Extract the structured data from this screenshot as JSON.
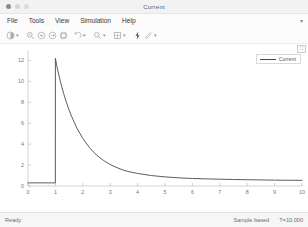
{
  "window": {
    "title": "Current",
    "controls": [
      "close",
      "minimize",
      "maximize"
    ]
  },
  "menubar": {
    "items": [
      {
        "label": "File"
      },
      {
        "label": "Tools"
      },
      {
        "label": "View"
      },
      {
        "label": "Simulation"
      },
      {
        "label": "Help"
      }
    ],
    "overflow": "▾"
  },
  "toolbar": {
    "groups": [
      {
        "icon": "print-icon",
        "dropdown": true
      },
      {
        "icon": "zoom-out-icon",
        "dropdown": false
      },
      {
        "icon": "zoom-in-icon",
        "dropdown": false
      },
      {
        "icon": "pan-icon",
        "dropdown": false
      },
      {
        "icon": "fit-to-view-icon",
        "dropdown": false
      },
      {
        "icon": "undo-arrow-icon",
        "dropdown": true
      },
      {
        "icon": "cursor-measure-icon",
        "dropdown": true
      },
      {
        "icon": "layout-grid-icon",
        "dropdown": true
      },
      {
        "icon": "trigger-bolt-icon",
        "dropdown": false
      },
      {
        "icon": "style-pencil-icon",
        "dropdown": true
      }
    ]
  },
  "legend": {
    "entries": [
      {
        "label": "Current",
        "color": "#4a4a4a"
      }
    ]
  },
  "plot_buttons": {
    "expand": "⛶"
  },
  "statusbar": {
    "state": "Ready",
    "mode": "Sample based",
    "time": "T=10.000"
  },
  "chart_data": {
    "type": "line",
    "title": "",
    "xlabel": "",
    "ylabel": "",
    "xlim": [
      0,
      10
    ],
    "ylim": [
      0,
      13
    ],
    "xticks": [
      0,
      1,
      2,
      3,
      4,
      5,
      6,
      7,
      8,
      9,
      10
    ],
    "yticks": [
      0,
      2,
      4,
      6,
      8,
      10,
      12
    ],
    "grid": false,
    "legend_position": "top-right",
    "series": [
      {
        "name": "Current",
        "color": "#4a4a4a",
        "x": [
          0,
          0.25,
          0.5,
          0.75,
          0.999,
          1.0,
          1.05,
          1.1,
          1.2,
          1.3,
          1.4,
          1.5,
          1.6,
          1.8,
          2.0,
          2.25,
          2.5,
          2.75,
          3.0,
          3.25,
          3.5,
          3.75,
          4.0,
          4.5,
          5.0,
          5.5,
          6.0,
          6.5,
          7.0,
          7.5,
          8.0,
          8.5,
          9.0,
          9.5,
          10.0
        ],
        "y": [
          0.3,
          0.3,
          0.3,
          0.3,
          0.3,
          12.2,
          11.5,
          10.9,
          9.8,
          8.85,
          8.0,
          7.25,
          6.6,
          5.45,
          4.55,
          3.65,
          2.95,
          2.45,
          2.05,
          1.75,
          1.5,
          1.33,
          1.2,
          1.0,
          0.87,
          0.78,
          0.72,
          0.68,
          0.65,
          0.62,
          0.6,
          0.58,
          0.56,
          0.55,
          0.54
        ]
      }
    ]
  }
}
